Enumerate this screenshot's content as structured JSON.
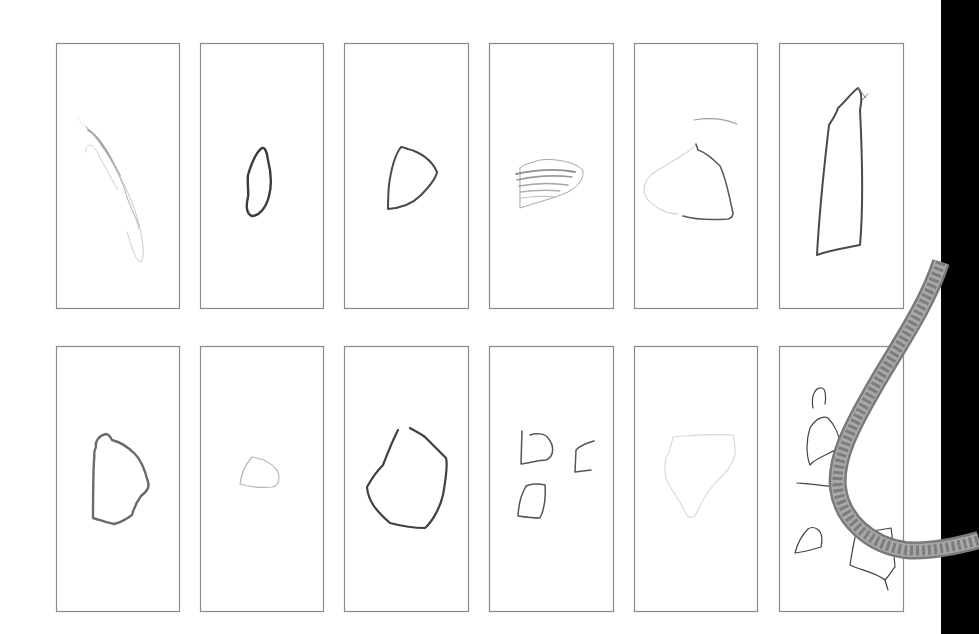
{
  "sheet": {
    "background": "#ffffff",
    "frame_stroke": "#8a8a8a",
    "black_band": {
      "x": 941,
      "width": 38,
      "color": "#000000"
    }
  },
  "panels": [
    {
      "id": "r1c1",
      "x": 56,
      "y": 43,
      "w": 123,
      "h": 265,
      "strokes": [
        {
          "d": "M86 127 C100 140 118 165 128 200 C134 215 138 222 139 228",
          "color": "#bdbdbd",
          "width": 1.2
        },
        {
          "d": "M88 130 C100 136 112 160 120 176",
          "color": "#9e9e9e",
          "width": 1.8
        },
        {
          "d": "M92 133 C105 150 120 172 133 205 C142 230 146 255 141 262 C135 262 130 240 127 232",
          "color": "#c8c8c8",
          "width": 1
        },
        {
          "d": "M86 152 C85 145 90 142 96 150 C104 165 112 180 118 190",
          "color": "#d0d0d0",
          "width": 1
        },
        {
          "d": "M76 117 L90 130",
          "color": "#dddddd",
          "width": 0.8
        }
      ]
    },
    {
      "id": "r1c2",
      "x": 200,
      "y": 43,
      "w": 123,
      "h": 265,
      "strokes": [
        {
          "d": "M262 148 C256 152 251 165 248 175 C247 185 249 192 248 197 C246 205 246 214 252 216 C259 216 266 208 269 196 C272 185 271 172 268 160 C267 152 265 147 262 148 Z",
          "color": "#3c3c3c",
          "width": 2.4
        }
      ]
    },
    {
      "id": "r1c3",
      "x": 344,
      "y": 43,
      "w": 124,
      "h": 265,
      "strokes": [
        {
          "d": "M401 147 C395 155 391 170 389 185 C388 195 388 205 388 209 C400 208 412 204 420 196 C428 188 436 178 437 172 C432 160 420 152 408 149 C405 148 403 147 401 147 Z",
          "color": "#4a4a4a",
          "width": 2
        }
      ]
    },
    {
      "id": "r1c4",
      "x": 489,
      "y": 43,
      "w": 124,
      "h": 265,
      "strokes": [
        {
          "d": "M520 168 L520 208 C535 203 555 198 568 192 C580 185 584 178 583 170 C575 162 555 158 540 160 C530 163 522 165 520 168 Z",
          "color": "#a8a8a8",
          "width": 1
        },
        {
          "d": "M516 174 C535 170 555 168 575 172",
          "color": "#8f8f8f",
          "width": 1.8
        },
        {
          "d": "M517 180 C535 176 555 175 572 177",
          "color": "#9a9a9a",
          "width": 1.6
        },
        {
          "d": "M519 186 C535 183 555 183 568 185",
          "color": "#a5a5a5",
          "width": 1.5
        },
        {
          "d": "M520 192 C535 190 550 190 560 191",
          "color": "#b0b0b0",
          "width": 1.3
        },
        {
          "d": "M521 198 C535 196 548 196 555 197",
          "color": "#bbbbbb",
          "width": 1.2
        }
      ]
    },
    {
      "id": "r1c5",
      "x": 634,
      "y": 43,
      "w": 123,
      "h": 265,
      "strokes": [
        {
          "d": "M694 120 C705 118 720 117 737 124",
          "color": "#a0a0a0",
          "width": 1.2
        },
        {
          "d": "M696 145 C690 152 670 162 655 172 C645 178 640 190 648 200 C658 210 668 214 678 214",
          "color": "#c6c6c6",
          "width": 1
        },
        {
          "d": "M696 144 L698 150 C705 152 712 158 720 166 C726 178 729 195 733 213 C733 216 732 218 728 219 C712 220 696 220 683 216",
          "color": "#5a5a5a",
          "width": 1.6
        }
      ]
    },
    {
      "id": "r1c6",
      "x": 779,
      "y": 43,
      "w": 124,
      "h": 265,
      "strokes": [
        {
          "d": "M858 88 C852 92 845 102 838 108 C836 115 832 120 829 125 C825 160 820 200 817 255 C830 250 845 248 860 245 C864 200 862 150 860 110 C862 100 862 92 858 88 Z",
          "color": "#4a4a4a",
          "width": 2
        },
        {
          "d": "M858 88 L866 98 M862 100 L868 94",
          "color": "#7a7a7a",
          "width": 1
        }
      ]
    },
    {
      "id": "r2c1",
      "x": 56,
      "y": 346,
      "w": 123,
      "h": 265,
      "strokes": [
        {
          "d": "M106 434 C98 436 95 442 96 447 C93 452 95 456 94 460 C93 480 93 500 93 518 C100 520 108 523 114 524 C122 522 128 518 132 515 C134 508 138 500 141 496 C146 492 150 488 148 482 C145 470 141 460 135 454 C128 447 120 442 112 440 C110 436 108 434 106 434 Z",
          "color": "#6a6a6a",
          "width": 2.4
        }
      ]
    },
    {
      "id": "r2c2",
      "x": 200,
      "y": 346,
      "w": 123,
      "h": 265,
      "strokes": [
        {
          "d": "M252 457 C246 464 241 474 240 484 C250 487 262 488 272 487 C280 486 280 476 277 470 C272 464 264 459 256 458 C254 457 253 457 252 457 Z",
          "color": "#b5b5b5",
          "width": 1.2
        }
      ]
    },
    {
      "id": "r2c3",
      "x": 344,
      "y": 346,
      "w": 124,
      "h": 265,
      "strokes": [
        {
          "d": "M398 430 C393 440 388 452 383 465 C378 470 372 478 367 487 C368 500 375 510 390 523 C405 527 418 528 425 528 C432 522 440 508 443 495 C446 478 448 465 446 458 C440 452 432 444 425 437 C418 432 413 430 410 428",
          "color": "#404040",
          "width": 2.2
        }
      ]
    },
    {
      "id": "r2c4",
      "x": 489,
      "y": 346,
      "w": 124,
      "h": 265,
      "strokes": [
        {
          "d": "M522 431 L521 464 C530 463 538 460 546 460 C555 456 554 445 548 438 C545 433 535 433 530 435",
          "color": "#555555",
          "width": 1.5
        },
        {
          "d": "M594 441 C586 443 580 446 576 450 L575 472 L591 470",
          "color": "#555555",
          "width": 1.5
        },
        {
          "d": "M526 486 C522 494 519 500 518 516 C525 517 535 518 540 518 C545 508 546 498 545 485 C538 483 530 484 526 486 Z",
          "color": "#555555",
          "width": 1.5
        }
      ]
    },
    {
      "id": "r2c5",
      "x": 634,
      "y": 346,
      "w": 123,
      "h": 265,
      "strokes": [
        {
          "d": "M673 437 C671 445 670 452 666 458 C664 468 665 478 669 485 C675 495 680 500 686 514 C690 520 695 518 698 510 C702 500 707 492 718 480 C728 472 733 462 735 455 C735 445 735 440 733 435 C718 434 700 435 685 436 C680 436 676 436 673 437 Z",
          "color": "#d7d7d7",
          "width": 1.1
        }
      ]
    },
    {
      "id": "r2c6",
      "x": 779,
      "y": 346,
      "w": 124,
      "h": 265,
      "strokes": [
        {
          "d": "M813 408 C811 398 814 387 822 388 C826 389 826 398 825 404",
          "color": "#444",
          "width": 1.2
        },
        {
          "d": "M810 465 C806 455 806 440 810 428 C815 420 822 415 828 418 C835 425 840 436 840 446 C835 452 825 454 813 462 Z",
          "color": "#444",
          "width": 1.2
        },
        {
          "d": "M851 425 C846 426 845 434 848 438 C852 438 856 436 856 430 C855 426 853 425 851 425 Z",
          "color": "#444",
          "width": 1.2
        },
        {
          "d": "M797 483 C808 484 822 485 842 488",
          "color": "#444",
          "width": 1.2
        },
        {
          "d": "M808 529 C800 537 797 545 795 553 C804 552 814 549 821 547 C823 540 822 532 817 529 C814 527 811 527 808 529 Z",
          "color": "#444",
          "width": 1.2
        },
        {
          "d": "M857 530 C854 540 852 552 850 565 C860 570 875 572 885 580 C890 575 892 570 895 567 C894 555 893 540 891 528 C880 530 870 532 857 530 Z",
          "color": "#444",
          "width": 1.2
        },
        {
          "d": "M885 580 L888 590",
          "color": "#444",
          "width": 1.2
        }
      ]
    }
  ],
  "cord": {
    "path": "M941 262 C925 310 895 350 870 395 C850 430 835 460 838 488 C842 520 870 545 905 550 C925 552 950 548 979 540",
    "outer_color": "#7a7a7a",
    "inner_color": "#a8a8a8",
    "pattern_color": "#5a5a5a",
    "width": 18
  }
}
